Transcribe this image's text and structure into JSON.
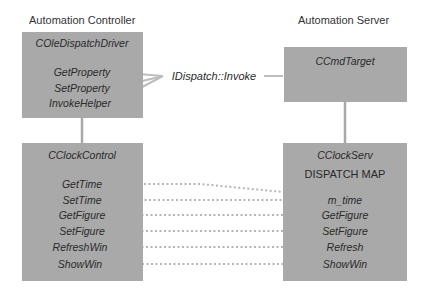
{
  "diagram": {
    "controller": {
      "title": "Automation Controller",
      "driver_box": {
        "name": "COleDispatchDriver",
        "methods": [
          "GetProperty",
          "SetProperty",
          "InvokeHelper"
        ]
      },
      "control_box": {
        "name": "CClockControl",
        "methods": [
          "GetTime",
          "SetTime",
          "GetFigure",
          "SetFigure",
          "RefreshWin",
          "ShowWin"
        ]
      }
    },
    "server": {
      "title": "Automation Server",
      "target_box": {
        "name": "CCmdTarget"
      },
      "serv_box": {
        "name": "CClockServ",
        "subtitle": "DISPATCH MAP",
        "entries": [
          "m_time",
          "GetFigure",
          "SetFigure",
          "Refresh",
          "ShowWin"
        ]
      }
    },
    "connector_label": "IDispatch::Invoke",
    "mappings": [
      {
        "from": "GetTime",
        "to": "m_time"
      },
      {
        "from": "SetTime",
        "to": "m_time"
      },
      {
        "from": "GetFigure",
        "to": "GetFigure"
      },
      {
        "from": "SetFigure",
        "to": "SetFigure"
      },
      {
        "from": "RefreshWin",
        "to": "Refresh"
      },
      {
        "from": "ShowWin",
        "to": "ShowWin"
      }
    ],
    "colors": {
      "box_fill": "#a9a9a9",
      "solid_line": "#b3b3b3",
      "dotted_line": "#b8b8b8"
    }
  }
}
